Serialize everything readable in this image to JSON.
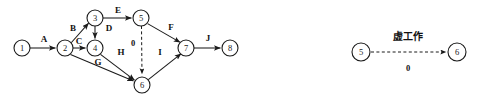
{
  "figure": {
    "title": "",
    "background_color": "#ffffff",
    "stroke_color": "#1a1a1a",
    "width": 478,
    "height": 108
  },
  "diagrams": [
    {
      "id": "main-network-diagram",
      "name": "activity-on-arrow-network",
      "nodes": [
        {
          "id": "n1",
          "label": "1",
          "x": 22,
          "y": 48,
          "r": 8
        },
        {
          "id": "n2",
          "label": "2",
          "x": 65,
          "y": 48,
          "r": 8
        },
        {
          "id": "n3",
          "label": "3",
          "x": 95,
          "y": 18,
          "r": 8
        },
        {
          "id": "n4",
          "label": "4",
          "x": 95,
          "y": 48,
          "r": 8
        },
        {
          "id": "n5",
          "label": "5",
          "x": 141,
          "y": 18,
          "r": 8
        },
        {
          "id": "n6",
          "label": "6",
          "x": 142,
          "y": 85,
          "r": 8
        },
        {
          "id": "n7",
          "label": "7",
          "x": 186,
          "y": 48,
          "r": 8
        },
        {
          "id": "n8",
          "label": "8",
          "x": 230,
          "y": 48,
          "r": 8
        }
      ],
      "edges": [
        {
          "id": "e-A",
          "from": "n1",
          "to": "n2",
          "label": "A",
          "label_x": 44,
          "label_y": 39,
          "style": "solid"
        },
        {
          "id": "e-B",
          "from": "n2",
          "to": "n3",
          "label": "B",
          "label_x": 73,
          "label_y": 28,
          "style": "solid"
        },
        {
          "id": "e-C",
          "from": "n2",
          "to": "n4",
          "label": "C",
          "label_x": 79,
          "label_y": 41,
          "style": "solid"
        },
        {
          "id": "e-D",
          "from": "n3",
          "to": "n4",
          "label": "D",
          "label_x": 109,
          "label_y": 28,
          "style": "solid"
        },
        {
          "id": "e-E",
          "from": "n3",
          "to": "n5",
          "label": "E",
          "label_x": 118,
          "label_y": 10,
          "style": "solid"
        },
        {
          "id": "e-F",
          "from": "n5",
          "to": "n7",
          "label": "F",
          "label_x": 171,
          "label_y": 27,
          "style": "solid"
        },
        {
          "id": "e-G",
          "from": "n2",
          "to": "n6",
          "label": "G",
          "label_x": 98,
          "label_y": 62,
          "style": "solid"
        },
        {
          "id": "e-H",
          "from": "n4",
          "to": "n6",
          "label": "H",
          "label_x": 121,
          "label_y": 52,
          "style": "solid"
        },
        {
          "id": "e-I",
          "from": "n6",
          "to": "n7",
          "label": "I",
          "label_x": 160,
          "label_y": 52,
          "style": "solid"
        },
        {
          "id": "e-J",
          "from": "n7",
          "to": "n8",
          "label": "J",
          "label_x": 208,
          "label_y": 38,
          "style": "solid"
        },
        {
          "id": "e-dummy",
          "from": "n5",
          "to": "n6",
          "label": "0",
          "label_x": 133,
          "label_y": 43,
          "style": "dashed"
        }
      ]
    },
    {
      "id": "dummy-activity-diagram",
      "name": "dummy-activity-legend",
      "nodes": [
        {
          "id": "d5",
          "label": "5",
          "x": 361,
          "y": 52,
          "r": 9
        },
        {
          "id": "d6",
          "label": "6",
          "x": 457,
          "y": 52,
          "r": 9
        }
      ],
      "edges": [
        {
          "id": "d-dummy",
          "from": "d5",
          "to": "d6",
          "label": "0",
          "label_x": 408,
          "label_y": 68,
          "style": "dashed"
        }
      ],
      "annotations": [
        {
          "id": "dummy-caption",
          "text": "虚工作",
          "x": 408,
          "y": 36,
          "script": "cjk"
        }
      ]
    }
  ]
}
